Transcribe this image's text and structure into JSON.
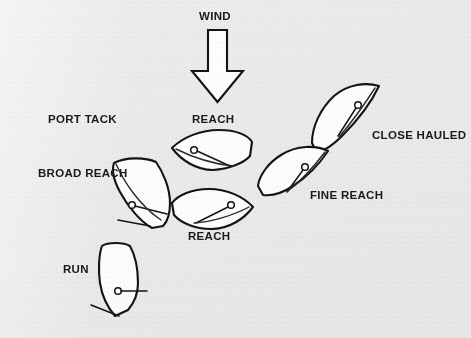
{
  "figure": {
    "background_color": "#ececec",
    "ink_color": "#141414",
    "hull_fill": "#ffffff"
  },
  "wind": {
    "label": "WIND",
    "direction": "down",
    "description": "Large hollow block arrow pointing downward from top center"
  },
  "labels": {
    "wind": "WIND",
    "port_tack": "PORT TACK",
    "reach_upper": "REACH",
    "reach_lower": "REACH",
    "close_hauled": "CLOSE HAULED",
    "fine_reach": "FINE REACH",
    "broad_reach": "BROAD REACH",
    "run": "RUN"
  },
  "boats": [
    {
      "id": "close-hauled",
      "label": "CLOSE HAULED",
      "heading_deg": 45,
      "description": "Hull angled bow up-right, sail trimmed in tight"
    },
    {
      "id": "fine-reach",
      "label": "FINE REACH",
      "heading_deg": 70,
      "description": "Hull angled bow up-right, sail eased slightly"
    },
    {
      "id": "reach-upper",
      "label": "REACH",
      "heading_deg": 270,
      "description": "Hull horizontal, bow to the left, sail eased"
    },
    {
      "id": "reach-lower",
      "label": "REACH",
      "heading_deg": 90,
      "description": "Hull horizontal, bow to the right, sail eased"
    },
    {
      "id": "broad-reach",
      "label": "BROAD REACH",
      "heading_deg": 25,
      "description": "Hull angled bow up-right steeply, boom well out"
    },
    {
      "id": "run",
      "label": "RUN",
      "heading_deg": 180,
      "description": "Hull vertical, bow pointing down, boom squared off"
    }
  ]
}
